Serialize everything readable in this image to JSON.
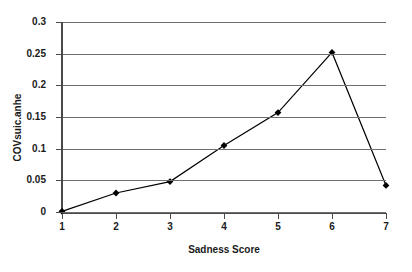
{
  "chart_data": {
    "type": "line",
    "title": "",
    "xlabel": "Sadness Score",
    "ylabel": "COVsuic.anhe",
    "categories": [
      "1",
      "2",
      "3",
      "4",
      "5",
      "6",
      "7"
    ],
    "values": [
      0.001,
      0.03,
      0.048,
      0.105,
      0.157,
      0.252,
      0.042
    ],
    "series": [
      {
        "name": "COVsuic.anhe",
        "values": [
          0.001,
          0.03,
          0.048,
          0.105,
          0.157,
          0.252,
          0.042
        ]
      }
    ],
    "x": [
      1,
      2,
      3,
      4,
      5,
      6,
      7
    ],
    "xlim": [
      1,
      7
    ],
    "ylim": [
      0,
      0.3
    ],
    "y_ticks": [
      0,
      0.05,
      0.1,
      0.15,
      0.2,
      0.25,
      0.3
    ],
    "y_tick_labels": [
      "0",
      "0.05",
      "0.1",
      "0.15",
      "0.2",
      "0.25",
      "0.3"
    ],
    "x_ticks": [
      1,
      2,
      3,
      4,
      5,
      6,
      7
    ],
    "x_tick_labels": [
      "1",
      "2",
      "3",
      "4",
      "5",
      "6",
      "7"
    ],
    "grid": "horizontal",
    "grid_color": "#6e6e6e",
    "legend": "none",
    "marker": "diamond",
    "marker_color": "#000000",
    "line_color": "#000000",
    "background_color": "#ffffff",
    "axis_color": "#4a4a4a"
  }
}
